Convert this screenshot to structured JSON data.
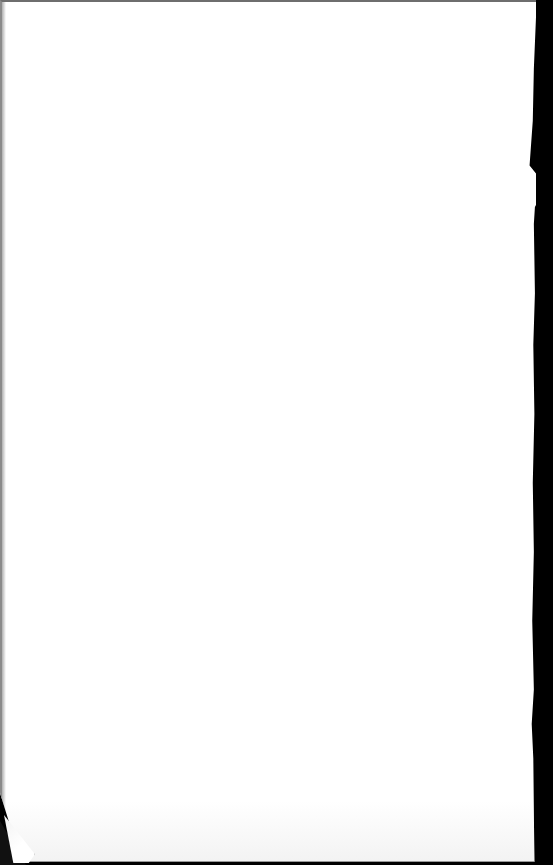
{
  "document": {
    "type": "scanned-page",
    "content_state": "blank",
    "text": "",
    "colors": {
      "paper": "#ffffff",
      "scanner_background": "#000000",
      "edge_border": "#8a8a8a"
    }
  }
}
